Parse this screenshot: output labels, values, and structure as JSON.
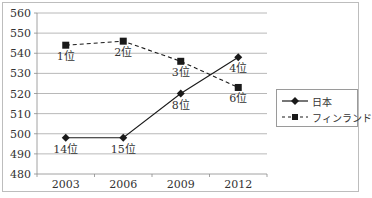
{
  "chart_data": {
    "type": "line",
    "title": "",
    "xlabel": "",
    "ylabel": "",
    "categories": [
      "2003",
      "2006",
      "2009",
      "2012"
    ],
    "ylim": [
      480,
      560
    ],
    "yticks": [
      480,
      490,
      500,
      510,
      520,
      530,
      540,
      550,
      560
    ],
    "grid": true,
    "legend_position": "right",
    "series": [
      {
        "name": "日本",
        "style": "solid",
        "marker": "diamond",
        "values": [
          498,
          498,
          520,
          538
        ],
        "labels": [
          "14位",
          "15位",
          "8位",
          "4位"
        ]
      },
      {
        "name": "フィンランド",
        "style": "dashed",
        "marker": "square",
        "values": [
          544,
          546,
          536,
          523
        ],
        "labels": [
          "1位",
          "2位",
          "3位",
          "6位"
        ]
      }
    ]
  },
  "legend": {
    "items": [
      {
        "label": "日本"
      },
      {
        "label": "フィンランド"
      }
    ]
  },
  "colors": {
    "line": "#1a1a1a",
    "grid": "#a6a6a6",
    "axis": "#8c8c8c"
  }
}
